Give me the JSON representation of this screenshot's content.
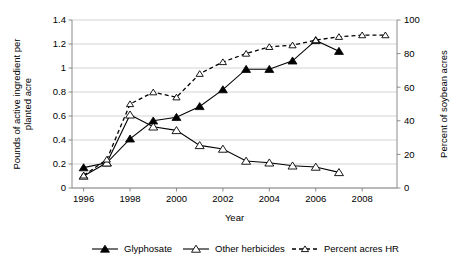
{
  "chart_data": {
    "type": "line",
    "title": "",
    "xlabel": "Year",
    "ylabel": "Pounds of active ingredient per planted acre",
    "y2label": "Percent of soybean acres",
    "x": [
      1996,
      1997,
      1998,
      1999,
      2000,
      2001,
      2002,
      2003,
      2004,
      2005,
      2006,
      2007,
      2008,
      2009
    ],
    "xlim": [
      1995.5,
      2009.5
    ],
    "xticks": [
      1996,
      1998,
      2000,
      2002,
      2004,
      2006,
      2008
    ],
    "xticklabels": [
      "1996",
      "1998",
      "2000",
      "2002",
      "2004",
      "2006",
      "2008"
    ],
    "ylim": [
      0,
      1.4
    ],
    "yticks": [
      0,
      0.2,
      0.4,
      0.6,
      0.8,
      1,
      1.2,
      1.4
    ],
    "yticklabels": [
      "0",
      "0.2",
      "0.4",
      "0.6",
      "0.8",
      "1",
      "1.2",
      "1.4"
    ],
    "y2lim": [
      0,
      100
    ],
    "y2ticks": [
      0,
      20,
      40,
      60,
      80,
      100
    ],
    "y2ticklabels": [
      "0",
      "20",
      "40",
      "60",
      "80",
      "100"
    ],
    "grid": true,
    "legend_position": "bottom",
    "series": [
      {
        "name": "Glyphosate",
        "axis": "left",
        "marker": "filled-triangle",
        "linestyle": "solid",
        "x": [
          1996,
          1997,
          1998,
          1999,
          2000,
          2001,
          2002,
          2003,
          2004,
          2005,
          2006,
          2007
        ],
        "values": [
          0.17,
          0.21,
          0.41,
          0.56,
          0.59,
          0.68,
          0.82,
          0.99,
          0.99,
          1.06,
          1.23,
          1.14
        ]
      },
      {
        "name": "Other herbicides",
        "axis": "left",
        "marker": "hollow-triangle",
        "linestyle": "solid",
        "x": [
          1996,
          1997,
          1998,
          1999,
          2000,
          2001,
          2002,
          2003,
          2004,
          2005,
          2006,
          2007
        ],
        "values": [
          0.1,
          0.21,
          0.61,
          0.51,
          0.48,
          0.355,
          0.325,
          0.225,
          0.21,
          0.185,
          0.175,
          0.13
        ]
      },
      {
        "name": "Percent acres HR",
        "axis": "right",
        "marker": "hollow-triangle",
        "linestyle": "dashed",
        "x": [
          1996,
          1997,
          1998,
          1999,
          2000,
          2001,
          2002,
          2003,
          2004,
          2005,
          2006,
          2007,
          2008,
          2009
        ],
        "values": [
          7.5,
          17,
          50,
          57,
          54,
          68,
          75,
          80,
          84,
          85,
          88,
          90,
          91,
          91
        ]
      }
    ]
  },
  "legend": {
    "items": [
      {
        "label": "Glyphosate"
      },
      {
        "label": "Other herbicides"
      },
      {
        "label": "Percent acres HR"
      }
    ]
  }
}
